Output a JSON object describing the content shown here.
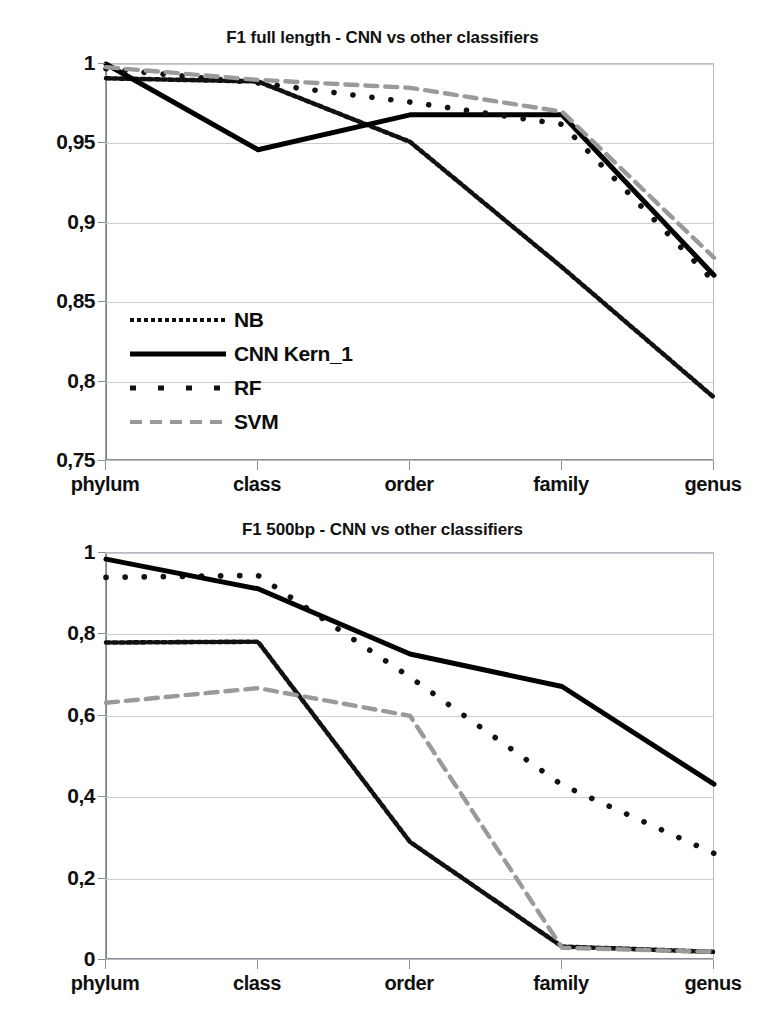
{
  "figure": {
    "panels": 2
  },
  "chart_data": [
    {
      "id": "top",
      "type": "line",
      "title": "F1 full length - CNN vs other classifiers",
      "xlabel": "",
      "ylabel": "",
      "categories": [
        "phylum",
        "class",
        "order",
        "family",
        "genus"
      ],
      "xtick_labels": [
        "phylum",
        "class",
        "order",
        "family",
        "genus"
      ],
      "ytick_labels": [
        "0,75",
        "0,8",
        "0,85",
        "0,9",
        "0,95",
        "1"
      ],
      "ytick_values": [
        0.75,
        0.8,
        0.85,
        0.9,
        0.95,
        1
      ],
      "ylim": [
        0.75,
        1.0
      ],
      "grid": true,
      "legend_position": "inside-lower-left",
      "series": [
        {
          "name": "NB",
          "style": "fine-dotted",
          "color": "#111111",
          "values": [
            0.991,
            0.989,
            0.951,
            0.872,
            0.79
          ]
        },
        {
          "name": "CNN Kern_1",
          "style": "solid",
          "color": "#000000",
          "values": [
            1.0,
            0.946,
            0.968,
            0.968,
            0.867
          ]
        },
        {
          "name": "RF",
          "style": "square-dots",
          "color": "#111111",
          "values": [
            0.997,
            0.988,
            0.976,
            0.962,
            0.863
          ]
        },
        {
          "name": "SVM",
          "style": "dashed",
          "color": "#9a9a9a",
          "values": [
            0.998,
            0.99,
            0.985,
            0.97,
            0.878
          ]
        }
      ]
    },
    {
      "id": "bottom",
      "type": "line",
      "title": "F1 500bp - CNN vs other classifiers",
      "xlabel": "",
      "ylabel": "",
      "categories": [
        "phylum",
        "class",
        "order",
        "family",
        "genus"
      ],
      "xtick_labels": [
        "phylum",
        "class",
        "order",
        "family",
        "genus"
      ],
      "ytick_labels": [
        "0",
        "0,2",
        "0,4",
        "0,6",
        "0,8",
        "1"
      ],
      "ytick_values": [
        0,
        0.2,
        0.4,
        0.6,
        0.8,
        1
      ],
      "ylim": [
        0.0,
        1.0
      ],
      "grid": true,
      "legend_position": "inside-lower-left",
      "series": [
        {
          "name": "NB",
          "style": "fine-dotted",
          "color": "#111111",
          "values": [
            0.78,
            0.782,
            0.29,
            0.033,
            0.02
          ]
        },
        {
          "name": "RF",
          "style": "square-dots",
          "color": "#111111",
          "values": [
            0.94,
            0.945,
            0.695,
            0.43,
            0.262
          ]
        },
        {
          "name": "SVM",
          "style": "dashed",
          "color": "#9a9a9a",
          "values": [
            0.632,
            0.668,
            0.6,
            0.03,
            0.02
          ]
        },
        {
          "name": "CNN Kern_1",
          "style": "solid",
          "color": "#000000",
          "values": [
            0.985,
            0.912,
            0.752,
            0.672,
            0.432
          ]
        }
      ]
    }
  ]
}
